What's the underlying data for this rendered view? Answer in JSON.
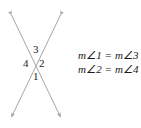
{
  "figure": {
    "name": "vertical-angles-diagram",
    "line_color": "#9b9b9b",
    "text_color": "#1a1a1a",
    "background_color": "#ffffff",
    "angle_labels": [
      {
        "id": "1",
        "text": "1",
        "position": "bottom"
      },
      {
        "id": "2",
        "text": "2",
        "position": "right"
      },
      {
        "id": "3",
        "text": "3",
        "position": "top"
      },
      {
        "id": "4",
        "text": "4",
        "position": "left"
      }
    ],
    "lines": [
      {
        "name": "line-a",
        "from": [
          10,
          12
        ],
        "to": [
          62,
          120
        ],
        "arrows": "both"
      },
      {
        "name": "line-b",
        "from": [
          62,
          12
        ],
        "to": [
          10,
          120
        ],
        "arrows": "both"
      }
    ],
    "intersection": [
      36,
      64
    ]
  },
  "equations": {
    "line1": "m∠1 = m∠3",
    "line2": "m∠2 = m∠4"
  }
}
